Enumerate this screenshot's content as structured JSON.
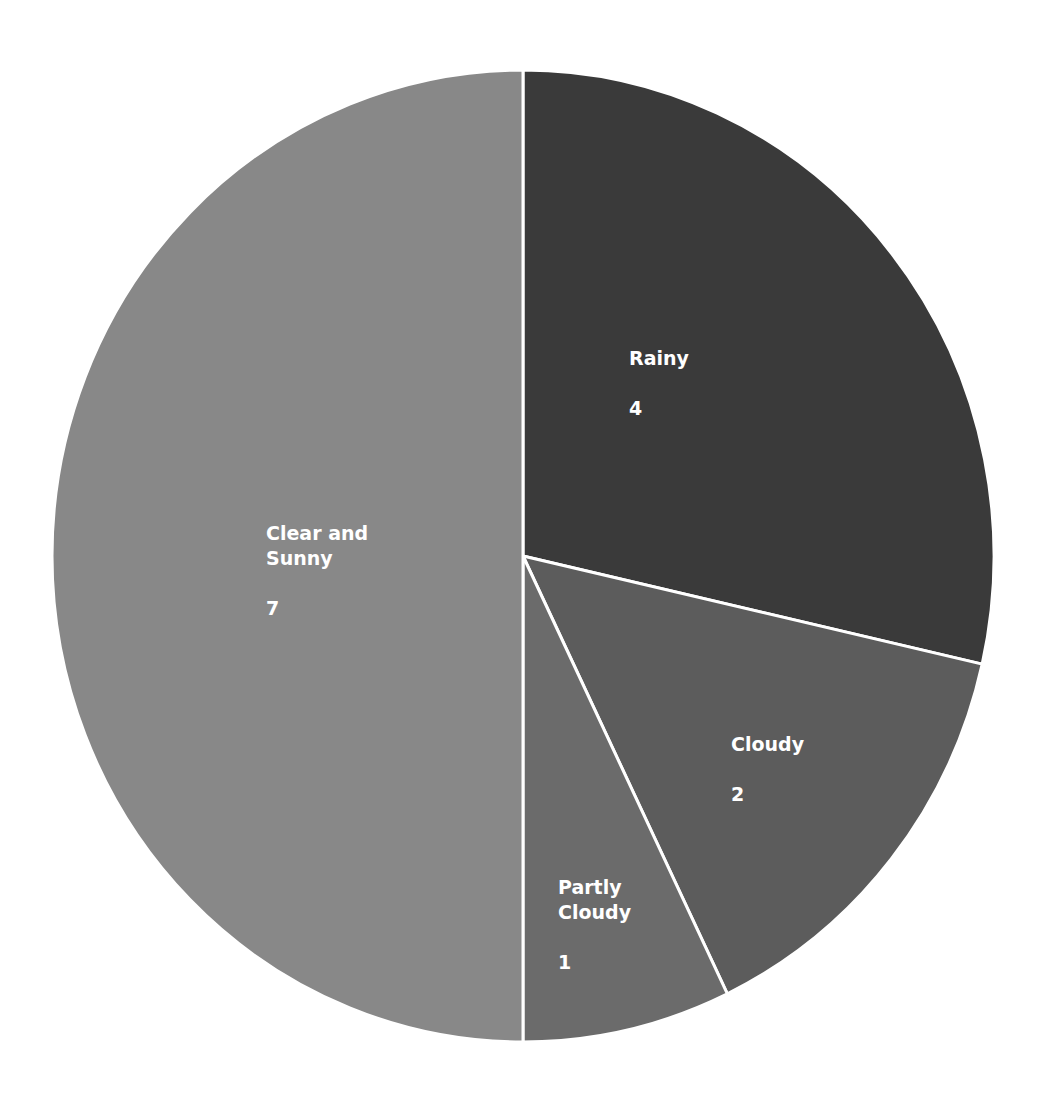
{
  "chart_data": {
    "type": "pie",
    "title": "",
    "start_angle_deg": 0,
    "direction": "clockwise",
    "total": 14,
    "slices": [
      {
        "label": "Rainy",
        "value": 4,
        "color": "#3a3a3a",
        "label_pos": [
          629,
          321
        ]
      },
      {
        "label": "Cloudy",
        "value": 2,
        "color": "#5c5c5c",
        "label_pos": [
          731,
          707
        ]
      },
      {
        "label": "Partly Cloudy",
        "value": 1,
        "color": "#6b6b6b",
        "label_pos": [
          558,
          850
        ]
      },
      {
        "label": "Clear and Sunny",
        "value": 7,
        "color": "#888888",
        "label_pos": [
          266,
          496
        ]
      }
    ],
    "labels_show_value": true,
    "legend": "none",
    "center": [
      523,
      556
    ],
    "radius": [
      471,
      486
    ]
  },
  "labels": [
    {
      "name": "Rainy",
      "value": "4"
    },
    {
      "name": "Cloudy",
      "value": "2"
    },
    {
      "name": "Partly\nCloudy",
      "value": "1"
    },
    {
      "name": "Clear and\nSunny",
      "value": "7"
    }
  ]
}
